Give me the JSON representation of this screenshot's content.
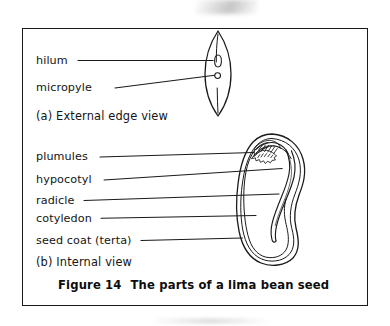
{
  "figure": {
    "caption_number": "Figure 14",
    "caption_text": "The parts of a lima bean seed",
    "border_color": "#1a1a1a",
    "ink_color": "#141414",
    "background_color": "#ffffff"
  },
  "panel_a": {
    "section_label": "(a)  External edge view",
    "labels": [
      {
        "text": "hilum"
      },
      {
        "text": "micropyle"
      }
    ]
  },
  "panel_b": {
    "section_label": "(b)  Internal view",
    "labels": [
      {
        "text": "plumules"
      },
      {
        "text": "hypocotyl"
      },
      {
        "text": "radicle"
      },
      {
        "text": "cotyledon"
      },
      {
        "text": "seed coat (terta)"
      }
    ]
  },
  "drawings": {
    "edge_view_name": "lima-bean-edge-view-drawing",
    "internal_view_name": "lima-bean-internal-view-drawing"
  }
}
